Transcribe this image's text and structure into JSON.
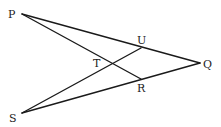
{
  "diagram": {
    "type": "geometry-figure",
    "points": {
      "P": {
        "label": "P",
        "x": 22,
        "y": 14,
        "lx": 8,
        "ly": 18
      },
      "Q": {
        "label": "Q",
        "x": 200,
        "y": 63,
        "lx": 203,
        "ly": 68
      },
      "S": {
        "label": "S",
        "x": 22,
        "y": 113,
        "lx": 9,
        "ly": 122
      },
      "U": {
        "label": "U",
        "x": 141,
        "y": 48,
        "lx": 137,
        "ly": 44
      },
      "R": {
        "label": "R",
        "x": 141,
        "y": 79,
        "lx": 137,
        "ly": 92
      },
      "T": {
        "label": "T",
        "x": 110,
        "y": 63,
        "lx": 93,
        "ly": 67
      }
    },
    "segments": [
      {
        "from": "P",
        "to": "Q"
      },
      {
        "from": "P",
        "to": "R"
      },
      {
        "from": "S",
        "to": "Q"
      },
      {
        "from": "S",
        "to": "U"
      }
    ],
    "labels": [
      "P",
      "Q",
      "S",
      "U",
      "R",
      "T"
    ]
  }
}
